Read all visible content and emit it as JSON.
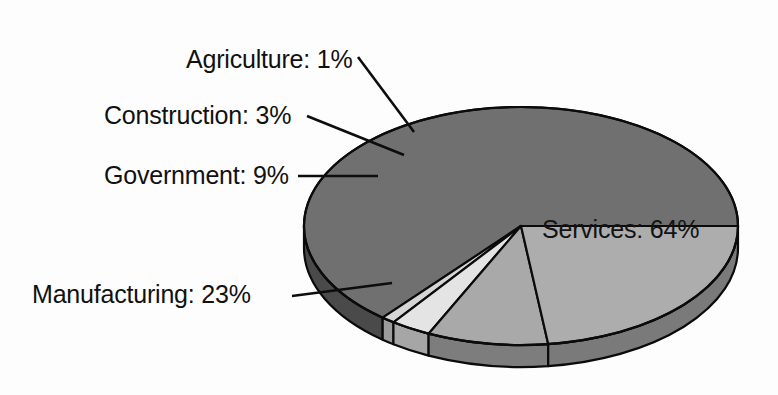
{
  "chart_data": {
    "type": "pie",
    "title": "",
    "subtitle": "",
    "xlabel": "",
    "ylabel": "",
    "legend_position": "none",
    "grid": false,
    "style": "3d-exploded-none",
    "categories": [
      "Agriculture",
      "Construction",
      "Government",
      "Manufacturing",
      "Services"
    ],
    "values": [
      1,
      3,
      9,
      23,
      64
    ],
    "unit": "%",
    "labels": [
      "Agriculture: 1%",
      "Construction: 3%",
      "Government: 9%",
      "Manufacturing: 23%",
      "Services: 64%"
    ],
    "slices": [
      {
        "name": "Agriculture",
        "value": 1,
        "label": "Agriculture: 1%",
        "color": "#d6d6d6",
        "side_color": "#9c9c9c",
        "label_placement": "outside-upper-left",
        "label_x": 186,
        "label_y": 68,
        "leader_from_x": 358,
        "leader_from_y": 57,
        "leader_to_x": 414,
        "leader_to_y": 132
      },
      {
        "name": "Construction",
        "value": 3,
        "label": "Construction: 3%",
        "color": "#e4e4e4",
        "side_color": "#a6a6a6",
        "label_placement": "outside-left",
        "label_x": 104,
        "label_y": 124,
        "leader_from_x": 307,
        "leader_from_y": 116,
        "leader_to_x": 404,
        "leader_to_y": 155
      },
      {
        "name": "Government",
        "value": 9,
        "label": "Government: 9%",
        "color": "#a9a9a9",
        "side_color": "#7d7d7d",
        "label_placement": "outside-left",
        "label_x": 104,
        "label_y": 184,
        "leader_from_x": 298,
        "leader_from_y": 176,
        "leader_to_x": 378,
        "leader_to_y": 176
      },
      {
        "name": "Manufacturing",
        "value": 23,
        "label": "Manufacturing: 23%",
        "color": "#adadad",
        "side_color": "#7a7a7a",
        "label_placement": "outside-lower-left",
        "label_x": 32,
        "label_y": 303,
        "leader_from_x": 292,
        "leader_from_y": 296,
        "leader_to_x": 392,
        "leader_to_y": 283
      },
      {
        "name": "Services",
        "value": 64,
        "label": "Services: 64%",
        "color": "#707070",
        "side_color": "#4a4a4a",
        "label_placement": "inside",
        "label_x": 542,
        "label_y": 238,
        "leader_from_x": 0,
        "leader_from_y": 0,
        "leader_to_x": 0,
        "leader_to_y": 0
      }
    ],
    "geometry": {
      "center_x": 521,
      "center_y": 226,
      "radius_x": 217,
      "radius_y": 119,
      "depth": 22,
      "start_angle_deg": 0,
      "direction": "counterclockwise"
    },
    "colors": {
      "background": "#fdfdfd",
      "outline": "#0b0b0b",
      "text": "#111111",
      "leader": "#0d0d0d"
    }
  }
}
